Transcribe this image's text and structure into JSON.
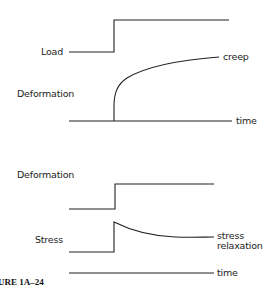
{
  "figure": {
    "caption": "URE 1A–24",
    "panels": [
      {
        "name": "creep",
        "rows": [
          {
            "label": "Load",
            "curve": "step-up"
          },
          {
            "label": "Deformation",
            "curve": "creep",
            "end_label": "creep"
          }
        ],
        "axis_label": "time"
      },
      {
        "name": "stress-relaxation",
        "rows": [
          {
            "label": "Deformation",
            "curve": "step-up"
          },
          {
            "label": "Stress",
            "curve": "jump-then-decay",
            "end_label_line1": "stress",
            "end_label_line2": "relaxation"
          }
        ],
        "axis_label": "time"
      }
    ]
  },
  "colors": {
    "line": "#222222",
    "background": "#ffffff"
  }
}
